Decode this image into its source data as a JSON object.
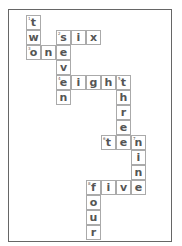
{
  "puzzle": {
    "origin": {
      "x": 26,
      "y": 15
    },
    "cell_size": 15,
    "cells": [
      {
        "col": 0,
        "row": 0,
        "letter": "t",
        "number": "1"
      },
      {
        "col": 0,
        "row": 1,
        "letter": "w",
        "number": ""
      },
      {
        "col": 0,
        "row": 2,
        "letter": "o",
        "number": "3"
      },
      {
        "col": 1,
        "row": 2,
        "letter": "n",
        "number": ""
      },
      {
        "col": 2,
        "row": 2,
        "letter": "e",
        "number": ""
      },
      {
        "col": 2,
        "row": 1,
        "letter": "s",
        "number": "2"
      },
      {
        "col": 3,
        "row": 1,
        "letter": "i",
        "number": ""
      },
      {
        "col": 4,
        "row": 1,
        "letter": "x",
        "number": ""
      },
      {
        "col": 2,
        "row": 3,
        "letter": "v",
        "number": ""
      },
      {
        "col": 2,
        "row": 4,
        "letter": "e",
        "number": "4"
      },
      {
        "col": 2,
        "row": 5,
        "letter": "n",
        "number": ""
      },
      {
        "col": 3,
        "row": 4,
        "letter": "i",
        "number": ""
      },
      {
        "col": 4,
        "row": 4,
        "letter": "g",
        "number": ""
      },
      {
        "col": 5,
        "row": 4,
        "letter": "h",
        "number": ""
      },
      {
        "col": 6,
        "row": 4,
        "letter": "t",
        "number": "5"
      },
      {
        "col": 6,
        "row": 5,
        "letter": "h",
        "number": ""
      },
      {
        "col": 6,
        "row": 6,
        "letter": "r",
        "number": ""
      },
      {
        "col": 6,
        "row": 7,
        "letter": "e",
        "number": ""
      },
      {
        "col": 5,
        "row": 8,
        "letter": "t",
        "number": "6"
      },
      {
        "col": 6,
        "row": 8,
        "letter": "e",
        "number": ""
      },
      {
        "col": 7,
        "row": 8,
        "letter": "n",
        "number": "7"
      },
      {
        "col": 7,
        "row": 9,
        "letter": "i",
        "number": ""
      },
      {
        "col": 7,
        "row": 10,
        "letter": "n",
        "number": ""
      },
      {
        "col": 4,
        "row": 11,
        "letter": "f",
        "number": "8"
      },
      {
        "col": 5,
        "row": 11,
        "letter": "i",
        "number": ""
      },
      {
        "col": 6,
        "row": 11,
        "letter": "v",
        "number": ""
      },
      {
        "col": 7,
        "row": 11,
        "letter": "e",
        "number": ""
      },
      {
        "col": 4,
        "row": 12,
        "letter": "o",
        "number": ""
      },
      {
        "col": 4,
        "row": 13,
        "letter": "u",
        "number": ""
      },
      {
        "col": 4,
        "row": 14,
        "letter": "r",
        "number": ""
      }
    ],
    "words": [
      "two",
      "six",
      "one",
      "seven",
      "eight",
      "three",
      "ten",
      "nine",
      "five",
      "four"
    ]
  }
}
